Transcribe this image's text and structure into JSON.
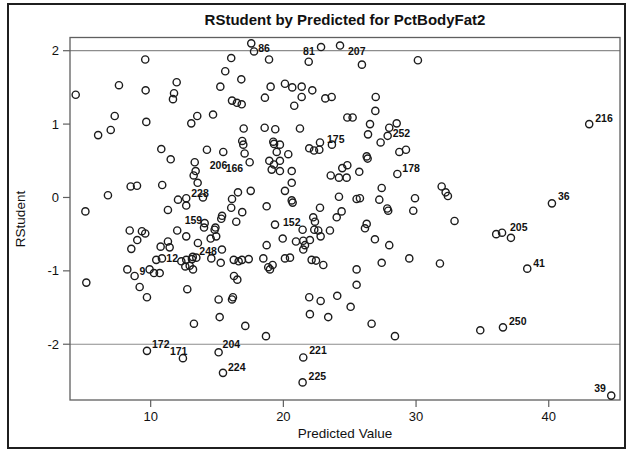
{
  "chart_data": {
    "type": "scatter",
    "title": "RStudent by Predicted for PctBodyFat2",
    "xlabel": "Predicted Value",
    "ylabel": "RStudent",
    "xlim": [
      3.92,
      45.37
    ],
    "ylim": [
      -2.76,
      2.18
    ],
    "x_ticks": [
      10,
      20,
      30,
      40
    ],
    "y_ticks": [
      2,
      1,
      0,
      -1,
      -2
    ],
    "reference_lines_y": [
      2,
      -2
    ],
    "grid": false,
    "legend": "none",
    "marker": "open-circle",
    "marker_radius": 3.6,
    "colors": {
      "marker": "#1c1c1c",
      "frame": "#5f5f5f",
      "refline": "#8d8d8d",
      "text": "#111111",
      "background": "#ffffff",
      "border": "#1f1f1f"
    },
    "labeled_points": [
      {
        "label": "86",
        "x": 17.58,
        "y": 2.1,
        "dx": 7,
        "dy": 9
      },
      {
        "label": "81",
        "x": 22.84,
        "y": 2.05,
        "dx": -18,
        "dy": 8
      },
      {
        "label": "207",
        "x": 24.27,
        "y": 2.07,
        "dx": 8,
        "dy": 9
      },
      {
        "label": "216",
        "x": 43.05,
        "y": 1.0,
        "dx": 6,
        "dy": -2
      },
      {
        "label": "252",
        "x": 27.86,
        "y": 0.84,
        "dx": 5,
        "dy": 1
      },
      {
        "label": "175",
        "x": 22.76,
        "y": 0.75,
        "dx": 7,
        "dy": 1
      },
      {
        "label": "206",
        "x": 13.32,
        "y": 0.48,
        "dx": 15,
        "dy": 7
      },
      {
        "label": "166",
        "x": 17.46,
        "y": 0.48,
        "dx": -24,
        "dy": 10
      },
      {
        "label": "178",
        "x": 28.59,
        "y": 0.32,
        "dx": 5,
        "dy": -2
      },
      {
        "label": "36",
        "x": 40.24,
        "y": -0.08,
        "dx": 6,
        "dy": -3
      },
      {
        "label": "228",
        "x": 12.68,
        "y": -0.01,
        "dx": 5,
        "dy": -1
      },
      {
        "label": "152",
        "x": 19.37,
        "y": -0.37,
        "dx": 8,
        "dy": 1
      },
      {
        "label": "159",
        "x": 14.07,
        "y": -0.35,
        "dx": -20,
        "dy": 1
      },
      {
        "label": "205",
        "x": 36.48,
        "y": -0.48,
        "dx": 8,
        "dy": -2
      },
      {
        "label": "248",
        "x": 13.44,
        "y": -0.82,
        "dx": 3,
        "dy": -3
      },
      {
        "label": "12",
        "x": 12.31,
        "y": -0.87,
        "dx": -15,
        "dy": 1
      },
      {
        "label": "9",
        "x": 8.79,
        "y": -1.07,
        "dx": 5,
        "dy": -1
      },
      {
        "label": "41",
        "x": 38.38,
        "y": -0.97,
        "dx": 6,
        "dy": -2
      },
      {
        "label": "250",
        "x": 36.55,
        "y": -1.77,
        "dx": 6,
        "dy": -2
      },
      {
        "label": "172",
        "x": 9.72,
        "y": -2.09,
        "dx": 5,
        "dy": -3
      },
      {
        "label": "171",
        "x": 12.43,
        "y": -2.19,
        "dx": -13,
        "dy": -3
      },
      {
        "label": "204",
        "x": 15.12,
        "y": -2.11,
        "dx": 4,
        "dy": -4
      },
      {
        "label": "221",
        "x": 21.5,
        "y": -2.18,
        "dx": 6,
        "dy": -3
      },
      {
        "label": "224",
        "x": 15.45,
        "y": -2.39,
        "dx": 5,
        "dy": -2
      },
      {
        "label": "225",
        "x": 21.45,
        "y": -2.52,
        "dx": 6,
        "dy": -2
      },
      {
        "label": "39",
        "x": 44.71,
        "y": -2.7,
        "dx": -17,
        "dy": -4
      }
    ],
    "points": [
      [
        17.79,
        1.99
      ],
      [
        16.07,
        1.9
      ],
      [
        9.59,
        1.88
      ],
      [
        15.62,
        1.72
      ],
      [
        16.83,
        1.61
      ],
      [
        7.61,
        1.53
      ],
      [
        15.25,
        1.51
      ],
      [
        9.62,
        1.46
      ],
      [
        11.96,
        1.57
      ],
      [
        11.76,
        1.42
      ],
      [
        11.68,
        1.34
      ],
      [
        4.35,
        1.4
      ],
      [
        16.13,
        1.32
      ],
      [
        16.5,
        1.29
      ],
      [
        16.86,
        1.27
      ],
      [
        14.7,
        1.13
      ],
      [
        13.51,
        1.11
      ],
      [
        13.06,
        1.01
      ],
      [
        7.29,
        1.11
      ],
      [
        9.67,
        1.03
      ],
      [
        6.99,
        0.92
      ],
      [
        6.04,
        0.85
      ],
      [
        17.01,
        0.94
      ],
      [
        16.9,
        0.77
      ],
      [
        16.98,
        0.72
      ],
      [
        14.24,
        0.65
      ],
      [
        15.47,
        0.62
      ],
      [
        17.08,
        0.6
      ],
      [
        10.8,
        0.66
      ],
      [
        11.51,
        0.52
      ],
      [
        13.39,
        0.36
      ],
      [
        13.24,
        0.3
      ],
      [
        13.54,
        0.2
      ],
      [
        8.49,
        0.15
      ],
      [
        8.97,
        0.16
      ],
      [
        10.87,
        0.17
      ],
      [
        6.78,
        0.03
      ],
      [
        12.06,
        -0.03
      ],
      [
        13.94,
        0.0
      ],
      [
        5.08,
        -0.19
      ],
      [
        11.3,
        -0.17
      ],
      [
        12.68,
        -0.11
      ],
      [
        16.58,
        0.07
      ],
      [
        17.54,
        0.09
      ],
      [
        16.13,
        -0.02
      ],
      [
        16.07,
        -0.14
      ],
      [
        16.9,
        -0.2
      ],
      [
        15.32,
        -0.29
      ],
      [
        15.38,
        -0.25
      ],
      [
        16.45,
        -0.33
      ],
      [
        18.92,
        1.88
      ],
      [
        21.91,
        1.85
      ],
      [
        25.92,
        1.81
      ],
      [
        30.14,
        1.87
      ],
      [
        19.04,
        1.51
      ],
      [
        20.12,
        1.55
      ],
      [
        20.67,
        1.5
      ],
      [
        21.38,
        1.51
      ],
      [
        22.18,
        1.46
      ],
      [
        21.38,
        1.37
      ],
      [
        18.61,
        1.36
      ],
      [
        20.82,
        1.25
      ],
      [
        23.16,
        1.35
      ],
      [
        23.64,
        1.37
      ],
      [
        26.96,
        1.37
      ],
      [
        26.93,
        1.18
      ],
      [
        24.82,
        1.09
      ],
      [
        25.22,
        1.09
      ],
      [
        26.53,
        1.0
      ],
      [
        28.54,
        1.01
      ],
      [
        27.98,
        0.95
      ],
      [
        26.38,
        0.86
      ],
      [
        27.33,
        0.75
      ],
      [
        18.59,
        0.95
      ],
      [
        19.39,
        0.93
      ],
      [
        21.25,
        0.94
      ],
      [
        19.24,
        0.76
      ],
      [
        19.3,
        0.73
      ],
      [
        19.74,
        0.72
      ],
      [
        19.5,
        0.62
      ],
      [
        20.37,
        0.59
      ],
      [
        21.95,
        0.67
      ],
      [
        22.31,
        0.64
      ],
      [
        22.71,
        0.65
      ],
      [
        23.66,
        0.72
      ],
      [
        26.28,
        0.56
      ],
      [
        26.35,
        0.53
      ],
      [
        28.74,
        0.62
      ],
      [
        29.24,
        0.65
      ],
      [
        18.94,
        0.5
      ],
      [
        19.29,
        0.45
      ],
      [
        19.74,
        0.5
      ],
      [
        19.12,
        0.38
      ],
      [
        19.74,
        0.36
      ],
      [
        20.63,
        0.36
      ],
      [
        24.44,
        0.4
      ],
      [
        24.82,
        0.44
      ],
      [
        24.77,
        0.27
      ],
      [
        24.19,
        0.27
      ],
      [
        23.57,
        0.3
      ],
      [
        25.72,
        0.35
      ],
      [
        20.63,
        0.2
      ],
      [
        20.12,
        0.09
      ],
      [
        24.19,
        0.01
      ],
      [
        22.76,
        -0.14
      ],
      [
        20.63,
        -0.04
      ],
      [
        20.7,
        -0.07
      ],
      [
        25.52,
        -0.02
      ],
      [
        25.77,
        -0.01
      ],
      [
        27.41,
        0.13
      ],
      [
        27.23,
        -0.03
      ],
      [
        27.83,
        -0.15
      ],
      [
        27.9,
        -0.18
      ],
      [
        29.92,
        -0.01
      ],
      [
        31.93,
        0.15
      ],
      [
        32.23,
        0.07
      ],
      [
        29.79,
        -0.18
      ],
      [
        18.74,
        -0.12
      ],
      [
        22.25,
        -0.27
      ],
      [
        22.38,
        -0.33
      ],
      [
        24.02,
        -0.27
      ],
      [
        24.39,
        -0.19
      ],
      [
        26.28,
        -0.36
      ],
      [
        32.4,
        0.02
      ],
      [
        32.9,
        -0.32
      ],
      [
        8.42,
        -0.45
      ],
      [
        9.34,
        -0.46
      ],
      [
        9.59,
        -0.49
      ],
      [
        8.99,
        -0.58
      ],
      [
        8.54,
        -0.7
      ],
      [
        10.75,
        -0.67
      ],
      [
        11.3,
        -0.6
      ],
      [
        11.43,
        -0.68
      ],
      [
        12.0,
        -0.45
      ],
      [
        12.68,
        -0.53
      ],
      [
        13.56,
        -0.62
      ],
      [
        14.02,
        -0.41
      ],
      [
        14.52,
        -0.56
      ],
      [
        14.82,
        -0.44
      ],
      [
        14.88,
        -0.41
      ],
      [
        14.94,
        -0.53
      ],
      [
        15.37,
        -0.71
      ],
      [
        14.57,
        -0.83
      ],
      [
        15.28,
        -0.89
      ],
      [
        10.42,
        -0.85
      ],
      [
        10.85,
        -0.83
      ],
      [
        12.68,
        -0.85
      ],
      [
        13.11,
        -0.84
      ],
      [
        13.17,
        -0.81
      ],
      [
        12.61,
        -0.94
      ],
      [
        12.94,
        -0.93
      ],
      [
        13.19,
        -0.98
      ],
      [
        8.24,
        -0.98
      ],
      [
        9.92,
        -0.98
      ],
      [
        10.25,
        -1.03
      ],
      [
        10.68,
        -1.03
      ],
      [
        5.15,
        -1.16
      ],
      [
        9.17,
        -1.22
      ],
      [
        9.72,
        -1.36
      ],
      [
        12.76,
        -1.25
      ],
      [
        15.12,
        -1.39
      ],
      [
        16.13,
        -1.39
      ],
      [
        16.2,
        -1.36
      ],
      [
        16.26,
        -0.85
      ],
      [
        16.63,
        -0.87
      ],
      [
        16.28,
        -1.07
      ],
      [
        16.53,
        -1.12
      ],
      [
        16.88,
        -0.85
      ],
      [
        17.39,
        -0.84
      ],
      [
        15.2,
        -1.63
      ],
      [
        13.26,
        -1.72
      ],
      [
        17.13,
        -1.75
      ],
      [
        18.74,
        -0.65
      ],
      [
        18.49,
        -0.83
      ],
      [
        18.86,
        -0.95
      ],
      [
        19.19,
        -0.92
      ],
      [
        18.99,
        -0.98
      ],
      [
        19.95,
        -0.56
      ],
      [
        20.12,
        -0.83
      ],
      [
        20.5,
        -0.82
      ],
      [
        20.95,
        -0.6
      ],
      [
        21.5,
        -0.59
      ],
      [
        21.5,
        -0.71
      ],
      [
        21.63,
        -0.65
      ],
      [
        22.0,
        -0.58
      ],
      [
        21.45,
        -0.44
      ],
      [
        22.33,
        -0.44
      ],
      [
        22.63,
        -0.45
      ],
      [
        22.81,
        -0.53
      ],
      [
        23.51,
        -0.45
      ],
      [
        22.13,
        -0.85
      ],
      [
        22.46,
        -0.86
      ],
      [
        23.01,
        -0.92
      ],
      [
        25.52,
        -0.98
      ],
      [
        26.15,
        -0.42
      ],
      [
        26.9,
        -0.57
      ],
      [
        27.98,
        -0.65
      ],
      [
        27.41,
        -0.89
      ],
      [
        29.49,
        -0.83
      ],
      [
        31.8,
        -0.9
      ],
      [
        25.52,
        -1.19
      ],
      [
        21.95,
        -1.36
      ],
      [
        22.81,
        -1.41
      ],
      [
        24.06,
        -1.34
      ],
      [
        25.07,
        -1.49
      ],
      [
        22.0,
        -1.59
      ],
      [
        23.38,
        -1.63
      ],
      [
        26.65,
        -1.72
      ],
      [
        18.69,
        -1.89
      ],
      [
        28.41,
        -1.89
      ],
      [
        36.04,
        -0.5
      ],
      [
        37.15,
        -0.55
      ],
      [
        34.84,
        -1.81
      ]
    ]
  }
}
